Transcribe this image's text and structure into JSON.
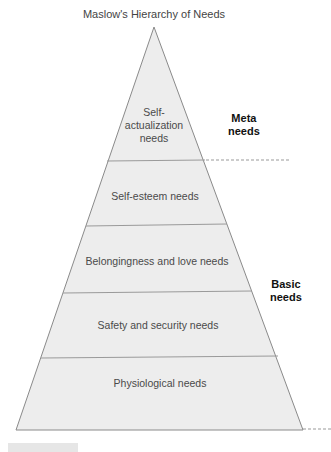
{
  "diagram": {
    "title": "Maslow's Hierarchy of Needs",
    "type": "pyramid",
    "layers_top_to_bottom": [
      {
        "label_lines": [
          "Self-",
          "actualization",
          "needs"
        ],
        "label": "Self-actualization needs"
      },
      {
        "label_lines": [
          "Self-esteem needs"
        ],
        "label": "Self-esteem needs"
      },
      {
        "label_lines": [
          "Belongingness and love needs"
        ],
        "label": "Belongingness and love needs"
      },
      {
        "label_lines": [
          "Safety and security needs"
        ],
        "label": "Safety and security needs"
      },
      {
        "label_lines": [
          "Physiological needs"
        ],
        "label": "Physiological needs"
      }
    ],
    "groups": [
      {
        "label_lines": [
          "Meta",
          "needs"
        ],
        "label": "Meta needs",
        "covers": [
          "Self-actualization needs"
        ]
      },
      {
        "label_lines": [
          "Basic",
          "needs"
        ],
        "label": "Basic needs",
        "covers": [
          "Self-esteem needs",
          "Belongingness and love needs",
          "Safety and security needs",
          "Physiological needs"
        ]
      }
    ],
    "colors": {
      "fill": "#ededed",
      "stroke": "#8a8a8a",
      "divider": "#9a9a9a",
      "group_label": "#111111"
    }
  }
}
